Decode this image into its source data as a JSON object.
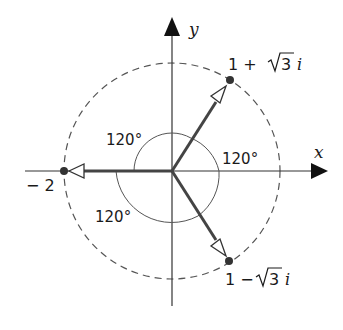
{
  "diagram": {
    "axes": {
      "x_label": "x",
      "y_label": "y"
    },
    "points": [
      {
        "label": "1 + √3 i",
        "label_parts": {
          "pre": "1 +",
          "root": "3",
          "post": "i"
        },
        "re": 1,
        "im": 1.7320508
      },
      {
        "label": "− 2",
        "re": -2,
        "im": 0
      },
      {
        "label": "1 − √3 i",
        "label_parts": {
          "pre": "1 −",
          "root": "3",
          "post": "i"
        },
        "re": 1,
        "im": -1.7320508
      }
    ],
    "angles": [
      {
        "label": "120°",
        "between": [
          "1 + √3 i",
          "− 2"
        ]
      },
      {
        "label": "120°",
        "between": [
          "1 − √3 i",
          "1 + √3 i"
        ]
      },
      {
        "label": "120°",
        "between": [
          "− 2",
          "1 − √3 i"
        ]
      }
    ],
    "circle": {
      "radius": 2,
      "style": "dashed"
    },
    "colors": {
      "ink": "#1a1a1a",
      "vector": "#444444",
      "arc": "#555555",
      "dashed_circle": "#555555"
    }
  }
}
